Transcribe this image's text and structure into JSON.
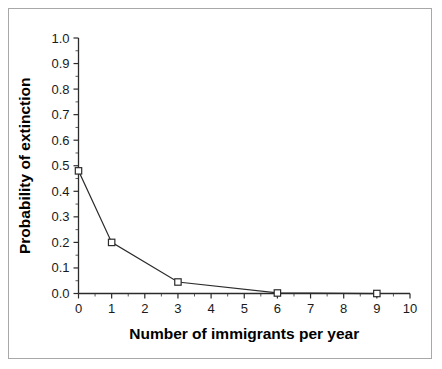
{
  "chart_data": {
    "type": "line",
    "title": "",
    "xlabel": "Number of immigrants per year",
    "ylabel": "Probability of extinction",
    "x": [
      0,
      1,
      3,
      6,
      9
    ],
    "values": [
      0.48,
      0.2,
      0.045,
      0.002,
      0.0
    ],
    "series": [
      {
        "name": "Probability of extinction",
        "x": [
          0,
          1,
          3,
          6,
          9
        ],
        "values": [
          0.48,
          0.2,
          0.045,
          0.002,
          0.0
        ]
      }
    ],
    "xlim": [
      0,
      10
    ],
    "ylim": [
      0.0,
      1.0
    ],
    "x_ticks": [
      0,
      1,
      2,
      3,
      4,
      5,
      6,
      7,
      8,
      9,
      10
    ],
    "x_tick_labels": [
      "0",
      "1",
      "2",
      "3",
      "4",
      "5",
      "6",
      "7",
      "8",
      "9",
      "10"
    ],
    "y_ticks": [
      0.0,
      0.1,
      0.2,
      0.3,
      0.4,
      0.5,
      0.6,
      0.7,
      0.8,
      0.9,
      1.0
    ],
    "y_tick_labels": [
      "0.0",
      "0.1",
      "0.2",
      "0.3",
      "0.4",
      "0.5",
      "0.6",
      "0.7",
      "0.8",
      "0.9",
      "1.0"
    ],
    "grid": false,
    "legend": false,
    "legend_position": "none",
    "marker": "open-square",
    "line_color": "#2b2b2b",
    "marker_fill": "#ffffff",
    "marker_edge": "#2b2b2b",
    "background_color": "#ffffff",
    "border_color": "#a8a8a8",
    "minor_ticks": true,
    "tick_direction": "out",
    "annotations": []
  }
}
